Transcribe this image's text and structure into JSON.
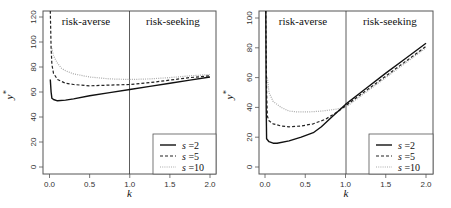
{
  "chart_data": [
    {
      "type": "line",
      "title": "",
      "xlabel": "k",
      "ylabel": "y*",
      "xlim": [
        0,
        2
      ],
      "ylim": [
        0,
        120
      ],
      "x_ticks": [
        "0.0",
        "0.5",
        "1.0",
        "1.5",
        "2.0"
      ],
      "y_ticks": [
        "0",
        "20",
        "40",
        "60",
        "80",
        "100",
        "120"
      ],
      "grid": false,
      "annotations": [
        {
          "text": "risk-averse",
          "region": "k<1"
        },
        {
          "text": "risk-seeking",
          "region": "k>1"
        },
        {
          "type": "vline",
          "x": 1.0
        }
      ],
      "legend_position": "bottom-right",
      "series": [
        {
          "name": "s =2",
          "style": "solid",
          "x": [
            0.01,
            0.02,
            0.03,
            0.05,
            0.1,
            0.2,
            0.3,
            0.5,
            0.75,
            1.0,
            1.25,
            1.5,
            1.75,
            2.0
          ],
          "values": [
            70,
            60,
            55,
            54,
            53,
            53.5,
            54.5,
            57,
            59.5,
            62,
            64.5,
            67,
            69.5,
            72
          ]
        },
        {
          "name": "s =5",
          "style": "dashed",
          "x": [
            0.01,
            0.02,
            0.03,
            0.05,
            0.1,
            0.2,
            0.3,
            0.5,
            0.75,
            1.0,
            1.25,
            1.5,
            1.75,
            2.0
          ],
          "values": [
            125,
            95,
            82,
            75,
            70,
            67,
            66,
            65,
            65.5,
            66,
            67.5,
            69.5,
            71.5,
            73
          ]
        },
        {
          "name": "s =10",
          "style": "dotted",
          "x": [
            0.03,
            0.05,
            0.1,
            0.15,
            0.2,
            0.3,
            0.5,
            0.75,
            1.0,
            1.25,
            1.5,
            1.75,
            2.0
          ],
          "values": [
            95,
            89,
            83,
            79,
            77,
            74.5,
            72,
            70.5,
            70,
            70.5,
            71.5,
            73,
            74
          ]
        }
      ]
    },
    {
      "type": "line",
      "title": "",
      "xlabel": "k",
      "ylabel": "y*",
      "xlim": [
        0,
        2
      ],
      "ylim": [
        0,
        100
      ],
      "x_ticks": [
        "0.0",
        "0.5",
        "1.0",
        "1.5",
        "2.0"
      ],
      "y_ticks": [
        "0",
        "20",
        "40",
        "60",
        "80",
        "100"
      ],
      "grid": false,
      "annotations": [
        {
          "text": "risk-averse",
          "region": "k<1"
        },
        {
          "text": "risk-seeking",
          "region": "k>1"
        },
        {
          "type": "vline",
          "x": 1.0
        }
      ],
      "legend_position": "bottom-right",
      "series": [
        {
          "name": "s =2",
          "style": "solid",
          "x": [
            0.01,
            0.015,
            0.02,
            0.05,
            0.1,
            0.15,
            0.3,
            0.45,
            0.6,
            0.7,
            0.8,
            1.0,
            1.25,
            1.5,
            1.75,
            2.0
          ],
          "values": [
            105,
            40,
            19,
            17,
            16,
            16,
            17.5,
            20,
            23,
            27,
            32,
            42,
            52.5,
            63,
            73,
            83
          ]
        },
        {
          "name": "s =5",
          "style": "dashed",
          "x": [
            0.01,
            0.02,
            0.03,
            0.05,
            0.1,
            0.2,
            0.3,
            0.45,
            0.6,
            0.75,
            0.9,
            1.0,
            1.25,
            1.5,
            1.75,
            2.0
          ],
          "values": [
            105,
            50,
            34,
            31,
            29,
            27.5,
            27,
            27.5,
            29,
            32,
            37,
            41,
            51,
            61,
            71,
            81
          ]
        },
        {
          "name": "s =10",
          "style": "dotted",
          "x": [
            0.03,
            0.05,
            0.1,
            0.2,
            0.3,
            0.4,
            0.55,
            0.7,
            0.85,
            1.0,
            1.25,
            1.5,
            1.75,
            2.0
          ],
          "values": [
            60,
            50,
            44,
            40,
            37.5,
            37,
            37,
            37.5,
            38.5,
            40,
            50,
            60,
            70,
            80
          ]
        }
      ]
    }
  ],
  "panels": [
    {
      "region_left": "risk-averse",
      "region_right": "risk-seeking",
      "xlabel": "k",
      "ylabel_base": "y",
      "ylabel_sup": "*",
      "x_ticks": [
        "0.0",
        "0.5",
        "1.0",
        "1.5",
        "2.0"
      ],
      "y_ticks": [
        "0",
        "20",
        "40",
        "60",
        "80",
        "100",
        "120"
      ],
      "legend": [
        {
          "var": "s",
          "eq": "=2"
        },
        {
          "var": "s",
          "eq": "=5"
        },
        {
          "var": "s",
          "eq": "=10"
        }
      ]
    },
    {
      "region_left": "risk-averse",
      "region_right": "risk-seeking",
      "xlabel": "k",
      "ylabel_base": "y",
      "ylabel_sup": "*",
      "x_ticks": [
        "0.0",
        "0.5",
        "1.0",
        "1.5",
        "2.0"
      ],
      "y_ticks": [
        "0",
        "20",
        "40",
        "60",
        "80",
        "100"
      ],
      "legend": [
        {
          "var": "s",
          "eq": "=2"
        },
        {
          "var": "s",
          "eq": "=5"
        },
        {
          "var": "s",
          "eq": "=10"
        }
      ]
    }
  ],
  "colors": {
    "axis": "#555555",
    "s2": "#111111",
    "s5": "#222222",
    "s10": "#aaaaaa"
  }
}
